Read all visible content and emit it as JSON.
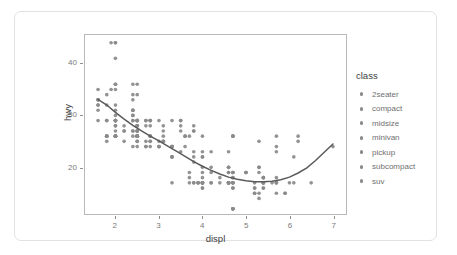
{
  "chart_data": {
    "type": "scatter",
    "title": "",
    "xlabel": "displ",
    "ylabel": "hwy",
    "xlim": [
      1.3,
      7.3
    ],
    "ylim": [
      11,
      45.5
    ],
    "xticks": [
      "2",
      "3",
      "4",
      "5",
      "6",
      "7"
    ],
    "xtick_values": [
      2,
      3,
      4,
      5,
      6,
      7
    ],
    "yticks": [
      "20",
      "30",
      "40"
    ],
    "ytick_values": [
      20,
      30,
      40
    ],
    "grid": false,
    "point_color": "#8a8a8a",
    "smooth_line_color": "#5a5a5a",
    "panel_border_color": "#b9b9b9",
    "legend": {
      "title": "class",
      "position": "right",
      "entries": [
        {
          "label": "2seater",
          "key": "legend-dot"
        },
        {
          "label": "compact",
          "key": "legend-dot"
        },
        {
          "label": "midsize",
          "key": "legend-dot"
        },
        {
          "label": "minivan",
          "key": "legend-dot"
        },
        {
          "label": "pickup",
          "key": "legend-dot"
        },
        {
          "label": "subcompact",
          "key": "legend-dot"
        },
        {
          "label": "suv",
          "key": "legend-dot"
        }
      ]
    },
    "points": [
      [
        1.8,
        29
      ],
      [
        1.8,
        29
      ],
      [
        2.0,
        31
      ],
      [
        2.0,
        30
      ],
      [
        2.8,
        26
      ],
      [
        2.8,
        26
      ],
      [
        3.1,
        27
      ],
      [
        1.8,
        26
      ],
      [
        1.8,
        25
      ],
      [
        2.0,
        28
      ],
      [
        2.0,
        27
      ],
      [
        2.8,
        25
      ],
      [
        2.8,
        25
      ],
      [
        3.1,
        25
      ],
      [
        3.1,
        25
      ],
      [
        2.8,
        24
      ],
      [
        3.1,
        25
      ],
      [
        4.2,
        23
      ],
      [
        5.3,
        20
      ],
      [
        5.3,
        15
      ],
      [
        5.3,
        20
      ],
      [
        5.7,
        17
      ],
      [
        6.0,
        17
      ],
      [
        5.7,
        26
      ],
      [
        5.7,
        23
      ],
      [
        6.2,
        26
      ],
      [
        6.2,
        25
      ],
      [
        7.0,
        24
      ],
      [
        5.3,
        19
      ],
      [
        5.3,
        14
      ],
      [
        5.7,
        15
      ],
      [
        6.5,
        17
      ],
      [
        2.4,
        27
      ],
      [
        2.4,
        30
      ],
      [
        3.1,
        26
      ],
      [
        3.5,
        29
      ],
      [
        3.6,
        26
      ],
      [
        2.4,
        24
      ],
      [
        3.0,
        24
      ],
      [
        3.3,
        22
      ],
      [
        3.3,
        22
      ],
      [
        3.3,
        24
      ],
      [
        3.3,
        24
      ],
      [
        3.3,
        17
      ],
      [
        3.8,
        22
      ],
      [
        3.8,
        21
      ],
      [
        3.8,
        23
      ],
      [
        4.0,
        23
      ],
      [
        3.7,
        19
      ],
      [
        3.7,
        18
      ],
      [
        3.9,
        17
      ],
      [
        3.9,
        17
      ],
      [
        4.7,
        19
      ],
      [
        4.7,
        19
      ],
      [
        4.7,
        12
      ],
      [
        5.2,
        17
      ],
      [
        5.2,
        15
      ],
      [
        3.9,
        17
      ],
      [
        4.7,
        17
      ],
      [
        4.7,
        12
      ],
      [
        4.7,
        17
      ],
      [
        5.2,
        16
      ],
      [
        5.7,
        18
      ],
      [
        5.9,
        15
      ],
      [
        4.7,
        16
      ],
      [
        4.7,
        12
      ],
      [
        4.7,
        17
      ],
      [
        4.7,
        17
      ],
      [
        4.7,
        16
      ],
      [
        4.7,
        12
      ],
      [
        5.2,
        15
      ],
      [
        5.2,
        16
      ],
      [
        5.7,
        17
      ],
      [
        5.9,
        15
      ],
      [
        4.6,
        17
      ],
      [
        5.4,
        17
      ],
      [
        5.4,
        18
      ],
      [
        4.0,
        17
      ],
      [
        4.0,
        19
      ],
      [
        4.0,
        17
      ],
      [
        4.0,
        17
      ],
      [
        4.6,
        19
      ],
      [
        5.0,
        19
      ],
      [
        4.2,
        17
      ],
      [
        4.2,
        17
      ],
      [
        4.6,
        17
      ],
      [
        4.6,
        17
      ],
      [
        4.6,
        17
      ],
      [
        5.4,
        16
      ],
      [
        5.4,
        16
      ],
      [
        3.8,
        17
      ],
      [
        3.8,
        17
      ],
      [
        4.0,
        16
      ],
      [
        4.0,
        17
      ],
      [
        4.6,
        17
      ],
      [
        4.6,
        17
      ],
      [
        4.6,
        17
      ],
      [
        4.6,
        17
      ],
      [
        5.4,
        17
      ],
      [
        1.6,
        33
      ],
      [
        1.6,
        33
      ],
      [
        1.6,
        32
      ],
      [
        1.6,
        32
      ],
      [
        1.6,
        29
      ],
      [
        1.8,
        32
      ],
      [
        1.8,
        34
      ],
      [
        2.0,
        36
      ],
      [
        2.4,
        36
      ],
      [
        2.4,
        29
      ],
      [
        2.4,
        33
      ],
      [
        2.4,
        34
      ],
      [
        2.5,
        36
      ],
      [
        2.5,
        34
      ],
      [
        3.3,
        29
      ],
      [
        2.0,
        26
      ],
      [
        2.0,
        26
      ],
      [
        2.0,
        26
      ],
      [
        2.0,
        26
      ],
      [
        2.7,
        25
      ],
      [
        2.7,
        24
      ],
      [
        2.7,
        24
      ],
      [
        3.0,
        24
      ],
      [
        3.7,
        17
      ],
      [
        4.0,
        22
      ],
      [
        4.7,
        19
      ],
      [
        4.7,
        18
      ],
      [
        4.7,
        18
      ],
      [
        5.7,
        17
      ],
      [
        6.1,
        17
      ],
      [
        4.0,
        22
      ],
      [
        4.2,
        19
      ],
      [
        4.4,
        18
      ],
      [
        4.6,
        20
      ],
      [
        5.4,
        17
      ],
      [
        5.4,
        18
      ],
      [
        5.4,
        18
      ],
      [
        4.0,
        17
      ],
      [
        4.0,
        16
      ],
      [
        4.6,
        19
      ],
      [
        5.0,
        19
      ],
      [
        2.4,
        31
      ],
      [
        2.4,
        26
      ],
      [
        2.5,
        28
      ],
      [
        2.5,
        27
      ],
      [
        3.5,
        29
      ],
      [
        3.5,
        27
      ],
      [
        3.0,
        24
      ],
      [
        3.0,
        25
      ],
      [
        3.5,
        23
      ],
      [
        3.3,
        24
      ],
      [
        3.3,
        22
      ],
      [
        4.0,
        18
      ],
      [
        5.6,
        17
      ],
      [
        3.1,
        28
      ],
      [
        3.8,
        27
      ],
      [
        3.8,
        28
      ],
      [
        3.8,
        27
      ],
      [
        5.3,
        25
      ],
      [
        2.5,
        26
      ],
      [
        2.5,
        25
      ],
      [
        2.5,
        25
      ],
      [
        2.5,
        26
      ],
      [
        2.5,
        26
      ],
      [
        2.5,
        24
      ],
      [
        2.2,
        27
      ],
      [
        2.2,
        25
      ],
      [
        2.5,
        26
      ],
      [
        2.5,
        28
      ],
      [
        2.5,
        26
      ],
      [
        2.5,
        28
      ],
      [
        2.2,
        28
      ],
      [
        2.2,
        27
      ],
      [
        2.5,
        27
      ],
      [
        2.5,
        26
      ],
      [
        2.5,
        29
      ],
      [
        2.5,
        27
      ],
      [
        3.3,
        24
      ],
      [
        2.0,
        44
      ],
      [
        2.0,
        41
      ],
      [
        2.0,
        29
      ],
      [
        2.0,
        26
      ],
      [
        2.5,
        28
      ],
      [
        2.5,
        29
      ],
      [
        2.8,
        29
      ],
      [
        2.8,
        29
      ],
      [
        3.6,
        24
      ],
      [
        2.0,
        44
      ],
      [
        2.5,
        29
      ],
      [
        2.0,
        26
      ],
      [
        2.0,
        29
      ],
      [
        2.0,
        29
      ],
      [
        2.0,
        29
      ],
      [
        2.0,
        28
      ],
      [
        2.7,
        29
      ],
      [
        2.7,
        29
      ],
      [
        2.7,
        28
      ],
      [
        3.0,
        29
      ],
      [
        3.7,
        26
      ],
      [
        4.0,
        26
      ],
      [
        4.7,
        26
      ],
      [
        4.7,
        26
      ],
      [
        4.7,
        26
      ],
      [
        5.7,
        24
      ],
      [
        6.1,
        22
      ],
      [
        4.0,
        20
      ],
      [
        4.2,
        20
      ],
      [
        4.4,
        17
      ],
      [
        4.6,
        23
      ],
      [
        5.4,
        17
      ],
      [
        5.4,
        17
      ],
      [
        5.4,
        17
      ],
      [
        4.0,
        17
      ],
      [
        4.0,
        17
      ],
      [
        4.6,
        20
      ],
      [
        5.0,
        19
      ],
      [
        2.4,
        31
      ],
      [
        1.6,
        35
      ],
      [
        1.6,
        31
      ],
      [
        1.6,
        33
      ],
      [
        1.8,
        26
      ],
      [
        1.8,
        26
      ],
      [
        1.8,
        26
      ],
      [
        2.0,
        26
      ],
      [
        2.4,
        29
      ],
      [
        2.4,
        27
      ],
      [
        2.4,
        30
      ],
      [
        2.4,
        31
      ],
      [
        2.5,
        27
      ],
      [
        2.5,
        26
      ],
      [
        3.5,
        28
      ],
      [
        1.9,
        44
      ],
      [
        2.0,
        29
      ],
      [
        2.0,
        26
      ],
      [
        2.0,
        29
      ],
      [
        2.5,
        29
      ],
      [
        2.8,
        29
      ],
      [
        1.9,
        35
      ],
      [
        2.0,
        35
      ],
      [
        2.0,
        32
      ],
      [
        2.0,
        36
      ],
      [
        2.5,
        26
      ],
      [
        2.5,
        29
      ],
      [
        2.8,
        28
      ],
      [
        2.8,
        26
      ],
      [
        3.6,
        26
      ]
    ],
    "smooth_curve": [
      [
        1.6,
        33.1
      ],
      [
        1.8,
        32.0
      ],
      [
        2.0,
        30.6
      ],
      [
        2.2,
        29.3
      ],
      [
        2.4,
        28.1
      ],
      [
        2.6,
        27.0
      ],
      [
        2.8,
        26.0
      ],
      [
        3.0,
        25.1
      ],
      [
        3.2,
        24.1
      ],
      [
        3.4,
        23.1
      ],
      [
        3.6,
        22.1
      ],
      [
        3.8,
        21.1
      ],
      [
        4.0,
        20.2
      ],
      [
        4.2,
        19.4
      ],
      [
        4.4,
        18.7
      ],
      [
        4.6,
        18.1
      ],
      [
        4.8,
        17.7
      ],
      [
        5.0,
        17.4
      ],
      [
        5.2,
        17.2
      ],
      [
        5.4,
        17.2
      ],
      [
        5.6,
        17.3
      ],
      [
        5.8,
        17.6
      ],
      [
        6.0,
        18.1
      ],
      [
        6.2,
        18.9
      ],
      [
        6.4,
        19.9
      ],
      [
        6.6,
        21.3
      ],
      [
        6.8,
        22.9
      ],
      [
        7.0,
        24.5
      ]
    ]
  }
}
